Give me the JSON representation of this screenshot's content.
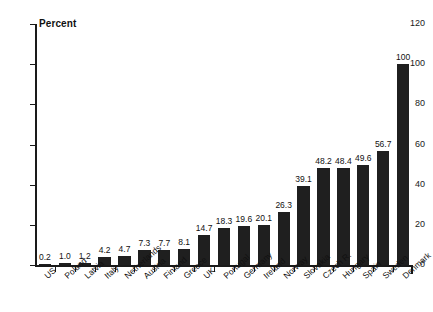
{
  "chart_data": {
    "type": "bar",
    "title": "",
    "xlabel": "",
    "ylabel": "Percent",
    "ylim": [
      0,
      120
    ],
    "yticks": [
      0,
      20,
      40,
      60,
      80,
      100,
      120
    ],
    "ytick_labels": [
      "0",
      "20",
      "40",
      "60",
      "80",
      "100",
      "120"
    ],
    "grid": false,
    "legend": false,
    "bar_color": "#1f1f1f",
    "axis_color": "#1a1a1a",
    "text_color": "#111111",
    "background": "#ffffff",
    "value_labels_shown": true,
    "categories": [
      "US",
      "Poland",
      "Latvia",
      "Italy",
      "Netherlands",
      "Austria",
      "Finland",
      "Greece",
      "UK",
      "Portugal",
      "Germany",
      "Ireland",
      "Norway",
      "Slovakia",
      "Czech R.",
      "Hungary",
      "Spain",
      "Sweden",
      "Denmark"
    ],
    "values": [
      0.2,
      1.0,
      1.2,
      4.2,
      4.7,
      7.3,
      7.7,
      8.1,
      14.7,
      18.3,
      19.6,
      20.1,
      26.3,
      39.1,
      48.2,
      48.4,
      49.6,
      56.7,
      100
    ],
    "value_labels": [
      "0.2",
      "1.0",
      "1.2",
      "4.2",
      "4.7",
      "7.3",
      "7.7",
      "8.1",
      "14.7",
      "18.3",
      "19.6",
      "20.1",
      "26.3",
      "39.1",
      "48.2",
      "48.4",
      "49.6",
      "56.7",
      "100"
    ]
  }
}
